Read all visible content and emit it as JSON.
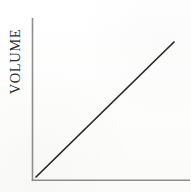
{
  "figure": {
    "background_color": "#fefefe",
    "width": 191,
    "height": 192
  },
  "axes": {
    "y_axis_label": "VOLUME",
    "x_axis_label": "",
    "axis_color": "#8c8c8c",
    "y_axis": {
      "x": 32,
      "y_top": 18,
      "y_bottom": 180
    },
    "x_axis": {
      "y": 180,
      "x_left": 32,
      "x_right": 190
    }
  },
  "series": {
    "name": "volume-trend",
    "color": "#272727",
    "stroke_width": 1.7,
    "start": {
      "x": 36,
      "y": 177
    },
    "end": {
      "x": 174,
      "y": 42
    }
  },
  "chart_data": {
    "type": "line",
    "title": "",
    "xlabel": "",
    "ylabel": "VOLUME",
    "grid": false,
    "legend": false,
    "axis_ticks": {
      "x": [],
      "y": []
    },
    "xlim": [
      0,
      1
    ],
    "ylim": [
      0,
      1
    ],
    "series": [
      {
        "name": "VOLUME",
        "color": "#272727",
        "x": [
          0.03,
          1.0
        ],
        "y": [
          0.02,
          0.85
        ],
        "description": "straight increasing line from lower-left origin to upper-right"
      }
    ],
    "annotations": []
  }
}
